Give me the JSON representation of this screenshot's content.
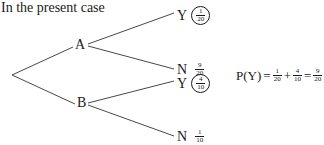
{
  "caption": "In the present case",
  "tree": {
    "nodes": [
      {
        "id": "A",
        "label": "A"
      },
      {
        "id": "B",
        "label": "B"
      }
    ],
    "leaves": [
      {
        "parent": "A",
        "label": "Y",
        "num": "1",
        "den": "20",
        "circled": true
      },
      {
        "parent": "A",
        "label": "N",
        "num": "9",
        "den": "20",
        "circled": false
      },
      {
        "parent": "B",
        "label": "Y",
        "num": "4",
        "den": "10",
        "circled": true
      },
      {
        "parent": "B",
        "label": "N",
        "num": "1",
        "den": "10",
        "circled": false
      }
    ]
  },
  "formula": {
    "lhs": "P(Y)",
    "eq1": "=",
    "term1": {
      "num": "1",
      "den": "20"
    },
    "plus": "+",
    "term2": {
      "num": "4",
      "den": "10"
    },
    "eq2": "=",
    "result": {
      "num": "9",
      "den": "20"
    }
  }
}
